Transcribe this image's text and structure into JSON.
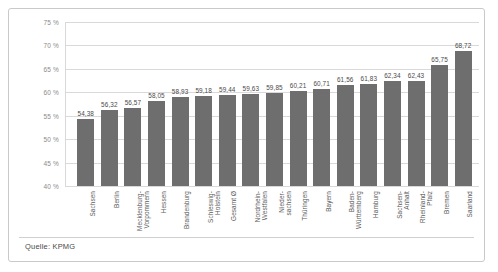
{
  "chart_data": {
    "type": "bar",
    "title": "",
    "xlabel": "",
    "ylabel": "",
    "ylim": [
      40,
      75
    ],
    "ytick_step": 5,
    "ytick_labels": [
      "75 %",
      "70 %",
      "65 %",
      "60 %",
      "55 %",
      "50 %",
      "45 %",
      "40 %"
    ],
    "ytick_values": [
      75,
      70,
      65,
      60,
      55,
      50,
      45,
      40
    ],
    "grid": true,
    "legend": false,
    "value_label_format": "german-decimal-comma",
    "bar_color": "#6e6e6e",
    "gridline_color": "#d9d9d9",
    "categories": [
      "Sachsen",
      "Berlin",
      "Mecklenburg-Vorpommern",
      "Hessen",
      "Brandenburg",
      "Schleswig-Holstein",
      "Gesamt Ø",
      "Nordrhein-Westfalen",
      "Nieder-sachsen",
      "Thüringen",
      "Bayern",
      "Baden-Württemberg",
      "Hamburg",
      "Sachsen-Anhalt",
      "Rheinland-Pfalz",
      "Bremen",
      "Saarland"
    ],
    "category_lines": [
      [
        "Sachsen"
      ],
      [
        "Berlin"
      ],
      [
        "Mecklenburg-",
        "Vorpommern"
      ],
      [
        "Hessen"
      ],
      [
        "Brandenburg"
      ],
      [
        "Schleswig-",
        "Holstein"
      ],
      [
        "Gesamt Ø"
      ],
      [
        "Nordrhein-",
        "Westfalen"
      ],
      [
        "Nieder-",
        "sachsen"
      ],
      [
        "Thüringen"
      ],
      [
        "Bayern"
      ],
      [
        "Baden-",
        "Württemberg"
      ],
      [
        "Hamburg"
      ],
      [
        "Sachsen-",
        "Anhalt"
      ],
      [
        "Rheinland-",
        "Pfalz"
      ],
      [
        "Bremen"
      ],
      [
        "Saarland"
      ]
    ],
    "values": [
      54.38,
      56.32,
      56.57,
      58.05,
      58.93,
      59.18,
      59.44,
      59.63,
      59.85,
      60.21,
      60.71,
      61.56,
      61.83,
      62.34,
      62.43,
      65.75,
      68.72
    ],
    "value_labels": [
      "54,38",
      "56,32",
      "56,57",
      "58,05",
      "58,93",
      "59,18",
      "59,44",
      "59,63",
      "59,85",
      "60,21",
      "60,71",
      "61,56",
      "61,83",
      "62,34",
      "62,43",
      "65,75",
      "68,72"
    ]
  },
  "caption": {
    "source": "Quelle: KPMG"
  }
}
